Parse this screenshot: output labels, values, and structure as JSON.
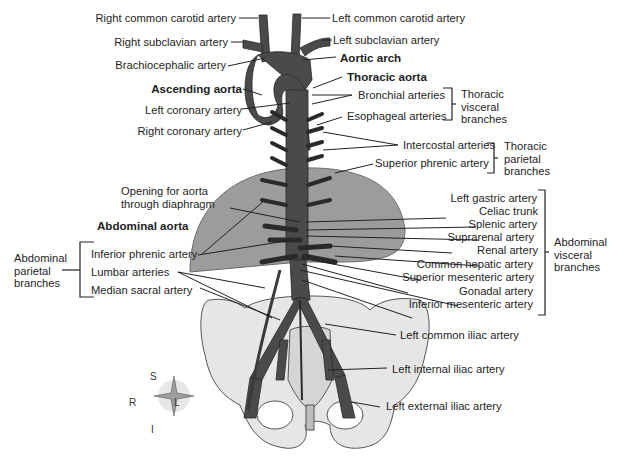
{
  "labels": {
    "right_common_carotid": "Right common carotid artery",
    "right_subclavian": "Right subclavian artery",
    "brachiocephalic": "Brachiocephalic artery",
    "ascending_aorta": "Ascending aorta",
    "left_coronary": "Left coronary artery",
    "right_coronary": "Right coronary artery",
    "left_common_carotid": "Left common carotid artery",
    "left_subclavian": "Left subclavian artery",
    "aortic_arch": "Aortic arch",
    "thoracic_aorta": "Thoracic aorta",
    "bronchial": "Bronchial arteries",
    "esophageal": "Esophageal arteries",
    "intercostal": "Intercostal arteries",
    "superior_phrenic": "Superior phrenic artery",
    "opening_line1": "Opening for aorta",
    "opening_line2": "through diaphragm",
    "abdominal_aorta": "Abdominal aorta",
    "inferior_phrenic": "Inferior phrenic artery",
    "lumbar": "Lumbar arteries",
    "median_sacral": "Median sacral artery",
    "left_gastric": "Left gastric artery",
    "celiac_trunk": "Celiac trunk",
    "splenic": "Splenic artery",
    "suprarenal": "Suprarenal artery",
    "renal": "Renal artery",
    "common_hepatic": "Common hepatic artery",
    "superior_mesenteric": "Superior mesenteric artery",
    "gonadal": "Gonadal artery",
    "inferior_mesenteric": "Inferior mesenteric artery",
    "left_common_iliac": "Left common iliac artery",
    "left_internal_iliac": "Left internal iliac artery",
    "left_external_iliac": "Left external iliac artery"
  },
  "groups": {
    "thoracic_visceral": [
      "Thoracic",
      "visceral",
      "branches"
    ],
    "thoracic_parietal": [
      "Thoracic",
      "parietal",
      "branches"
    ],
    "abdominal_visceral": [
      "Abdominal",
      "visceral",
      "branches"
    ],
    "abdominal_parietal": [
      "Abdominal",
      "parietal",
      "branches"
    ]
  },
  "compass": {
    "top": "S",
    "bottom": "I",
    "left": "R",
    "right": "L"
  },
  "colors": {
    "artery": "#4a4a4a",
    "diaphragm": "#9a9a9a",
    "bone": "#e8e8e8",
    "leader": "#222222"
  }
}
